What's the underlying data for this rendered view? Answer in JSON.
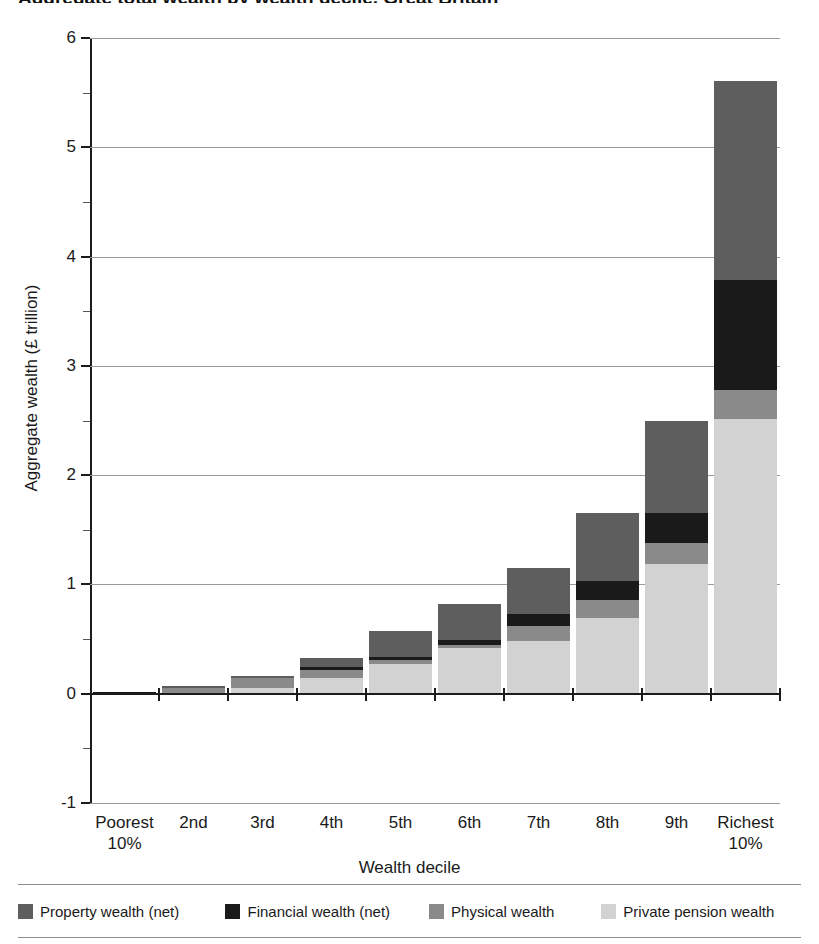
{
  "title": "Aggregate total wealth by wealth decile, Great Britain",
  "axis": {
    "y_label": "Aggregate wealth (£ trillion)",
    "x_label": "Wealth decile",
    "y_ticks": [
      "6",
      "5",
      "4",
      "3",
      "2",
      "1",
      "0",
      "-1"
    ],
    "y_tick_values": [
      6,
      5,
      4,
      3,
      2,
      1,
      0,
      -1
    ],
    "y_minor_values": [
      5.5,
      4.5,
      3.5,
      2.5,
      1.5,
      0.5,
      -0.5
    ]
  },
  "colors": {
    "property": "#5e5e5e",
    "financial": "#1a1a1a",
    "physical": "#8a8a8a",
    "pension": "#d2d2d2",
    "axis": "#1c1c1c",
    "grid": "#9a9a9a"
  },
  "legend": {
    "items": [
      {
        "label": "Property wealth (net)",
        "color_key": "property",
        "left_pct": 0
      },
      {
        "label": "Financial wealth (net)",
        "color_key": "financial",
        "left_pct": 26.5
      },
      {
        "label": "Physical wealth",
        "color_key": "physical",
        "left_pct": 52.5
      },
      {
        "label": "Private pension wealth",
        "color_key": "pension",
        "left_pct": 74.5
      }
    ]
  },
  "chart_data": {
    "type": "bar",
    "subtype": "stacked",
    "title": "Aggregate total wealth by wealth decile, Great Britain",
    "xlabel": "Wealth decile",
    "ylabel": "Aggregate wealth (£ trillion)",
    "ylim": [
      -1,
      6
    ],
    "grid": true,
    "legend_position": "bottom",
    "categories": [
      "Poorest 10%",
      "2nd",
      "3rd",
      "4th",
      "5th",
      "6th",
      "7th",
      "8th",
      "9th",
      "Richest 10%"
    ],
    "series": [
      {
        "name": "Private pension wealth",
        "color": "#d2d2d2",
        "values": [
          0.0,
          0.01,
          0.05,
          0.14,
          0.27,
          0.42,
          0.48,
          0.69,
          1.19,
          2.51
        ]
      },
      {
        "name": "Physical wealth",
        "color": "#8a8a8a",
        "values": [
          0.0,
          0.05,
          0.09,
          0.08,
          0.04,
          0.03,
          0.14,
          0.17,
          0.19,
          0.27
        ]
      },
      {
        "name": "Financial wealth (net)",
        "color": "#1a1a1a",
        "values": [
          0.02,
          0.0,
          0.0,
          0.02,
          0.03,
          0.04,
          0.11,
          0.17,
          0.27,
          1.01
        ]
      },
      {
        "name": "Property wealth (net)",
        "color": "#5e5e5e",
        "values": [
          0.0,
          0.01,
          0.02,
          0.09,
          0.23,
          0.33,
          0.42,
          0.62,
          0.85,
          1.82
        ]
      }
    ],
    "totals": [
      0.02,
      0.07,
      0.16,
      0.33,
      0.57,
      0.82,
      1.15,
      1.65,
      2.5,
      5.61
    ]
  }
}
